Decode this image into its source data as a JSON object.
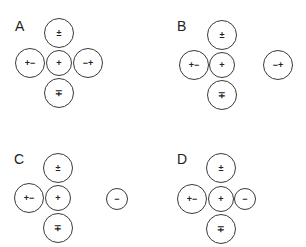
{
  "figure": {
    "type": "charge-distribution-options",
    "stroke_color": "#3a3a3a",
    "background": "#ffffff"
  },
  "panels": [
    {
      "label": "A",
      "circles": {
        "top": "±",
        "left": "+−",
        "center": "+",
        "right": "−+",
        "bottom": "∓"
      }
    },
    {
      "label": "B",
      "circles": {
        "top": "±",
        "left": "+−",
        "center": "+",
        "right": "−+",
        "bottom": "∓"
      }
    },
    {
      "label": "C",
      "circles": {
        "top": "±",
        "left": "+−",
        "center": "+",
        "right": "−",
        "bottom": "∓"
      }
    },
    {
      "label": "D",
      "circles": {
        "top": "±",
        "left": "+−",
        "center": "+",
        "right": "−",
        "bottom": "∓"
      }
    }
  ]
}
